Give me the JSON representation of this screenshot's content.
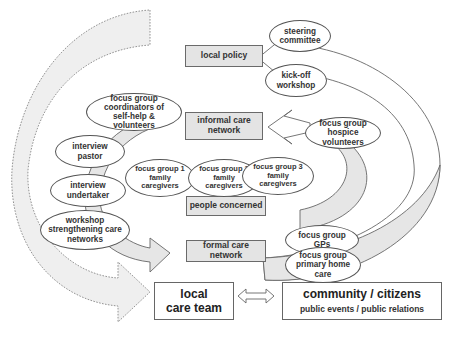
{
  "diagram": {
    "boxes": {
      "local_policy": "local policy",
      "informal_care_network": "informal care\nnetwork",
      "people_concerned": "people concerned",
      "formal_care_network": "formal care network",
      "local_care_team": "local\ncare team",
      "community_title": "community / citizens",
      "community_sub": "public events / public relations"
    },
    "ovals": {
      "steering_committee": "steering\ncommittee",
      "kickoff_workshop": "kick-off\nworkshop",
      "fg_coordinators": "focus group\ncoordinators of\nself-help &\nvolunteers",
      "fg_hospice": "focus group\nhospice\nvolunteers",
      "interview_pastor": "interview\npastor",
      "interview_undertaker": "interview\nundertaker",
      "fg_family1": "focus group 1\nfamily\ncaregivers",
      "fg_family2": "focus group 2\nfamily\ncaregivers",
      "fg_family3": "focus group 3\nfamily\ncaregivers",
      "workshop_networks": "workshop\nstrengthening care\nnetworks",
      "fg_gps": "focus group\nGPs",
      "fg_primary_home_care": "focus group\nprimary home\ncare"
    },
    "connectors": {
      "double_arrow": "bidirectional-arrow",
      "dotted_arc": "dashed-feedback-arrow",
      "outer_arc": "outer-return-arrow"
    },
    "colors": {
      "box_fill": "#e4e4e4",
      "arrow_fill": "#e8e8e8",
      "stroke": "#666666"
    }
  }
}
